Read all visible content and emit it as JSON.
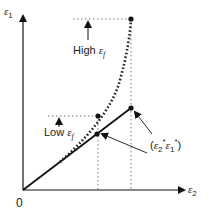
{
  "diagram": {
    "axes": {
      "y_label_symbol": "ε",
      "y_label_sub": "1",
      "x_label_symbol": "ε",
      "x_label_sub": "2",
      "origin_label": "0"
    },
    "annotations": {
      "high_text": "High",
      "high_symbol": "ε",
      "high_sub": "f",
      "low_text": "Low",
      "low_symbol": "ε",
      "low_sub": "f",
      "point_label_open": "(",
      "point_label_e2": "ε",
      "point_label_e2_sub": "2",
      "point_label_e2_sup": "*",
      "point_label_e1": "ε",
      "point_label_e1_sub": "1",
      "point_label_e1_sup": "*",
      "point_label_close": ")"
    },
    "colors": {
      "line": "#111111",
      "dotted": "#333333"
    }
  }
}
